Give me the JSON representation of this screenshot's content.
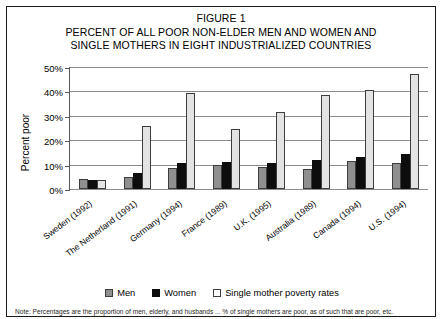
{
  "figure": {
    "title_lines": [
      "FIGURE 1",
      "PERCENT OF ALL POOR NON-ELDER MEN AND WOMEN AND",
      "SINGLE MOTHERS IN EIGHT INDUSTRIALIZED COUNTRIES"
    ],
    "note": "Note: Percentages are the proportion of men, elderly, and husbands ... % of single mothers are poor, as of such that are poor, etc."
  },
  "legend": {
    "items": [
      {
        "label": "Men",
        "color": "#8f8f8f",
        "key": "men"
      },
      {
        "label": "Women",
        "color": "#0d0d0d",
        "key": "women"
      },
      {
        "label": "Single mother poverty rates",
        "color": "#ffffff",
        "key": "single"
      }
    ]
  },
  "axis": {
    "y_label": "Percent poor",
    "y_ticks": [
      "0%",
      "10%",
      "20%",
      "30%",
      "40%",
      "50%"
    ],
    "y_tick_values": [
      0,
      10,
      20,
      30,
      40,
      50
    ]
  },
  "chart_data": {
    "type": "bar",
    "title": "PERCENT OF ALL POOR NON-ELDER MEN AND WOMEN AND SINGLE MOTHERS IN EIGHT INDUSTRIALIZED COUNTRIES",
    "subtitle": "FIGURE 1",
    "xlabel": "",
    "ylabel": "Percent poor",
    "ylim": [
      0,
      50
    ],
    "ytick_step": 10,
    "grid": true,
    "legend_position": "bottom",
    "categories": [
      "Sweden (1992)",
      "The Netherland (1991)",
      "Germany (1994)",
      "France (1989)",
      "U.K. (1995)",
      "Australia (1989)",
      "Canada (1994)",
      "U.S. (1994)"
    ],
    "series": [
      {
        "name": "Men",
        "color": "#8f8f8f",
        "values": [
          4.0,
          5.0,
          8.5,
          10.0,
          9.0,
          8.0,
          11.5,
          10.5
        ]
      },
      {
        "name": "Women",
        "color": "#0d0d0d",
        "values": [
          3.5,
          6.5,
          10.5,
          11.0,
          10.5,
          12.0,
          13.0,
          14.5
        ]
      },
      {
        "name": "Single mother poverty rates",
        "color": "#e3e3e3",
        "values": [
          3.5,
          26.0,
          39.5,
          24.5,
          31.5,
          38.5,
          40.5,
          47.0
        ]
      }
    ]
  }
}
